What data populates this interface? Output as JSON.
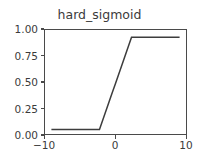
{
  "figure": {
    "background_color": "#ffffff",
    "axes_color": "#4a4a4a",
    "text_color": "#3b3b3b"
  },
  "chart_data": {
    "type": "line",
    "title": "hard_sigmoid",
    "xlabel": "",
    "ylabel": "",
    "xlim": [
      -11.0,
      11.0
    ],
    "ylim": [
      -0.05,
      1.08
    ],
    "grid": false,
    "legend": null,
    "line_color": "#3d3d3d",
    "line_width": 1.5,
    "xticks": [
      -10,
      0,
      10
    ],
    "xtick_labels": [
      "−10",
      "0",
      "10"
    ],
    "yticks": [
      0.0,
      0.25,
      0.5,
      0.75,
      1.0
    ],
    "ytick_labels": [
      "0.00",
      "0.25",
      "0.50",
      "0.75",
      "1.00"
    ],
    "series": [
      {
        "name": "hard_sigmoid",
        "x": [
          -10.0,
          -9.0,
          -8.0,
          -7.0,
          -6.0,
          -5.0,
          -4.0,
          -3.0,
          -2.5,
          -2.0,
          -1.5,
          -1.0,
          -0.5,
          0.0,
          0.5,
          1.0,
          1.5,
          2.0,
          2.5,
          3.0,
          4.0,
          5.0,
          6.0,
          7.0,
          8.0,
          9.0,
          10.0
        ],
        "y": [
          0.0,
          0.0,
          0.0,
          0.0,
          0.0,
          0.0,
          0.0,
          0.0,
          0.0,
          0.1,
          0.2,
          0.3,
          0.4,
          0.5,
          0.6,
          0.7,
          0.8,
          0.9,
          1.0,
          1.0,
          1.0,
          1.0,
          1.0,
          1.0,
          1.0,
          1.0,
          1.0
        ]
      }
    ]
  }
}
